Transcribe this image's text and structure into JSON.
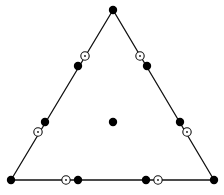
{
  "diagram": {
    "title": "",
    "type": "triangular-element-nodes",
    "colors": {
      "stroke": "#111111",
      "filled": "#000000",
      "open_fill": "#ffffff"
    },
    "triangle": {
      "vertices": [
        [
          113,
          10
        ],
        [
          11,
          180
        ],
        [
          214,
          180
        ]
      ]
    },
    "filled_nodes": [
      {
        "id": "v-top",
        "x": 113,
        "y": 10
      },
      {
        "id": "v-left",
        "x": 11,
        "y": 180
      },
      {
        "id": "v-right",
        "x": 214,
        "y": 180
      },
      {
        "id": "left-1",
        "x": 78,
        "y": 66
      },
      {
        "id": "left-2",
        "x": 45,
        "y": 122
      },
      {
        "id": "right-1",
        "x": 147,
        "y": 66
      },
      {
        "id": "right-2",
        "x": 180,
        "y": 122
      },
      {
        "id": "bottom-1",
        "x": 78,
        "y": 180
      },
      {
        "id": "bottom-2",
        "x": 146,
        "y": 180
      },
      {
        "id": "center",
        "x": 113,
        "y": 122
      }
    ],
    "open_nodes": [
      {
        "id": "left-open-1",
        "x": 85,
        "y": 56
      },
      {
        "id": "left-open-2",
        "x": 38,
        "y": 132
      },
      {
        "id": "right-open-1",
        "x": 140,
        "y": 56
      },
      {
        "id": "right-open-2",
        "x": 187,
        "y": 132
      },
      {
        "id": "bottom-open-1",
        "x": 66,
        "y": 180
      },
      {
        "id": "bottom-open-2",
        "x": 158,
        "y": 180
      }
    ]
  }
}
